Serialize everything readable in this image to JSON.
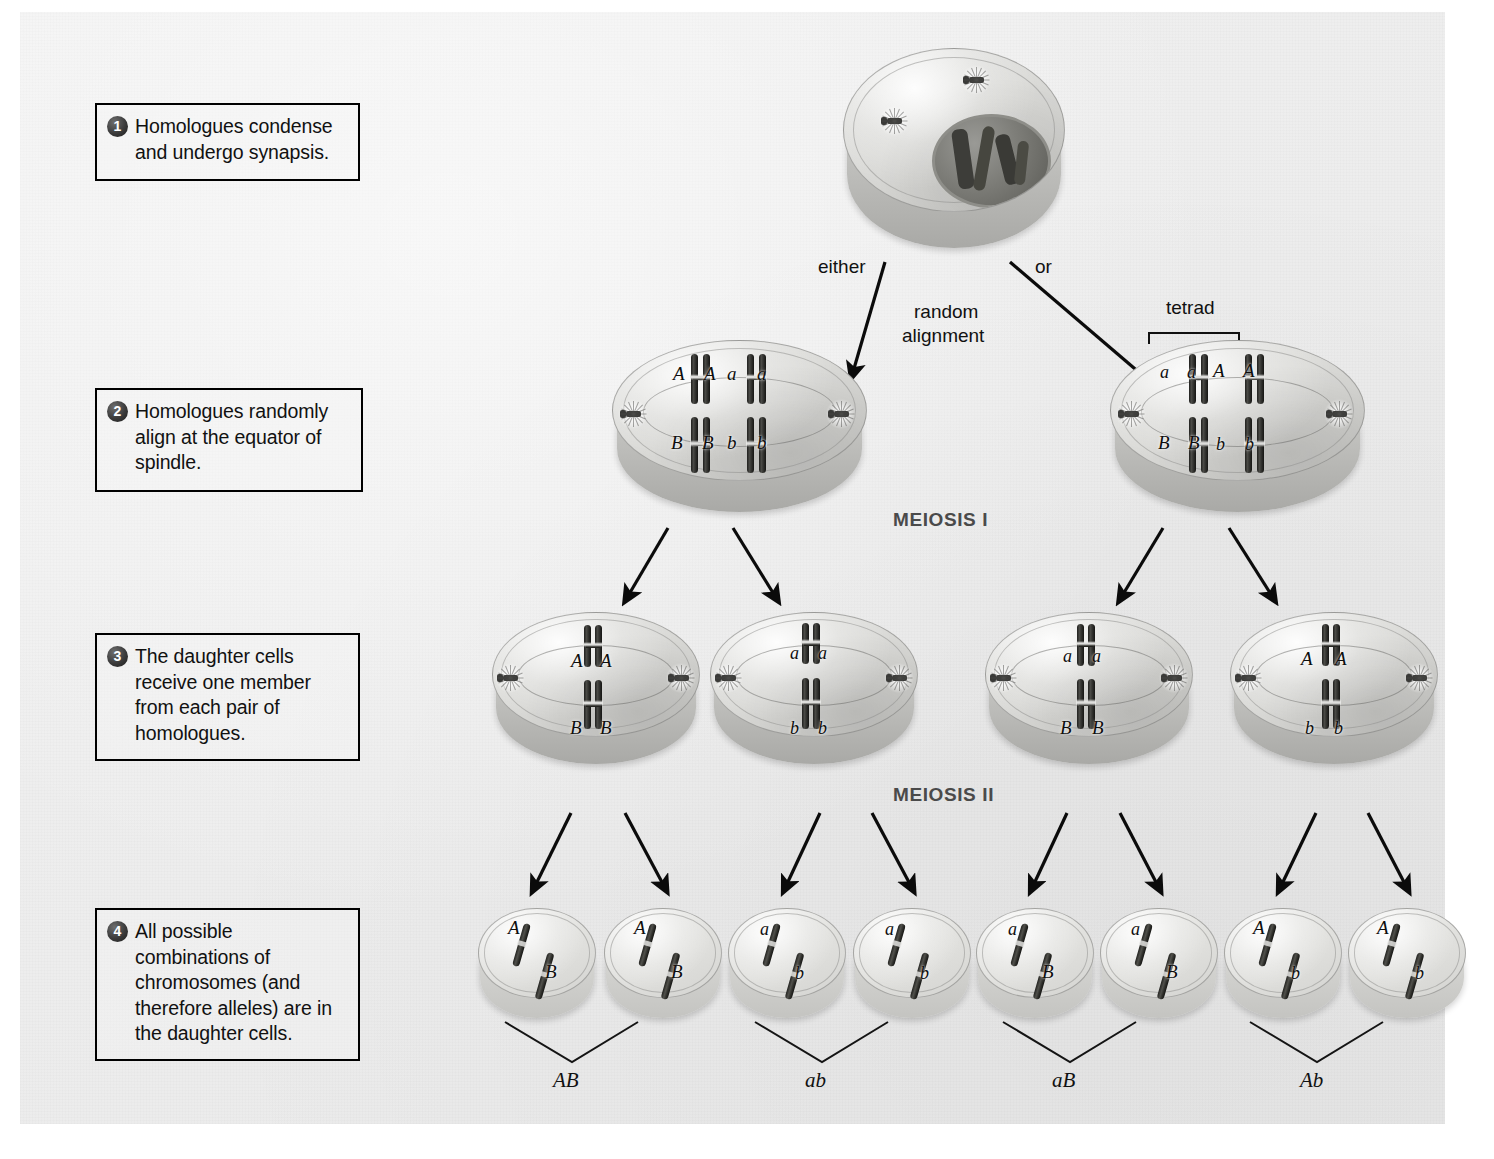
{
  "steps": [
    {
      "number": "1",
      "text": "Homologues condense and undergo synapsis."
    },
    {
      "number": "2",
      "text": "Homologues randomly align at the equator of spindle."
    },
    {
      "number": "3",
      "text": "The daughter cells receive one member from each pair of homologues."
    },
    {
      "number": "4",
      "text": "All possible combinations of chromosomes (and therefore alleles) are in the daughter cells."
    }
  ],
  "labels": {
    "either": "either",
    "or": "or",
    "random_alignment": "random\nalignment",
    "random_alignment_line1": "random",
    "random_alignment_line2": "alignment",
    "tetrad": "tetrad",
    "meiosis_i": "MEIOSIS I",
    "meiosis_ii": "MEIOSIS II"
  },
  "prophase_cell": {
    "name": "prophase-I-cell",
    "description": "Cell with intact nucleus containing condensing homologues and two centrosomes"
  },
  "metaphase_i_cells": [
    {
      "name": "metaphase-I-left",
      "top_alleles": [
        "A",
        "A",
        "a",
        "a"
      ],
      "bottom_alleles": [
        "B",
        "B",
        "b",
        "b"
      ],
      "tetrad_bracket": false
    },
    {
      "name": "metaphase-I-right",
      "top_alleles": [
        "a",
        "a",
        "A",
        "A"
      ],
      "bottom_alleles": [
        "B",
        "B",
        "b",
        "b"
      ],
      "tetrad_bracket": true
    }
  ],
  "meiosis_ii_cells": [
    {
      "name": "meiosis-II-cell-1",
      "top_alleles": [
        "A",
        "A"
      ],
      "bottom_alleles": [
        "B",
        "B"
      ]
    },
    {
      "name": "meiosis-II-cell-2",
      "top_alleles": [
        "a",
        "a"
      ],
      "bottom_alleles": [
        "b",
        "b"
      ]
    },
    {
      "name": "meiosis-II-cell-3",
      "top_alleles": [
        "a",
        "a"
      ],
      "bottom_alleles": [
        "B",
        "B"
      ]
    },
    {
      "name": "meiosis-II-cell-4",
      "top_alleles": [
        "A",
        "A"
      ],
      "bottom_alleles": [
        "b",
        "b"
      ]
    }
  ],
  "gametes": [
    {
      "name": "gamete-1",
      "upper_allele": "A",
      "lower_allele": "B"
    },
    {
      "name": "gamete-2",
      "upper_allele": "A",
      "lower_allele": "B"
    },
    {
      "name": "gamete-3",
      "upper_allele": "a",
      "lower_allele": "b"
    },
    {
      "name": "gamete-4",
      "upper_allele": "a",
      "lower_allele": "b"
    },
    {
      "name": "gamete-5",
      "upper_allele": "a",
      "lower_allele": "B"
    },
    {
      "name": "gamete-6",
      "upper_allele": "a",
      "lower_allele": "B"
    },
    {
      "name": "gamete-7",
      "upper_allele": "A",
      "lower_allele": "b"
    },
    {
      "name": "gamete-8",
      "upper_allele": "A",
      "lower_allele": "b"
    }
  ],
  "genotype_groups": [
    {
      "name": "genotype-AB",
      "label": "AB"
    },
    {
      "name": "genotype-ab",
      "label": "ab"
    },
    {
      "name": "genotype-aB",
      "label": "aB"
    },
    {
      "name": "genotype-Ab",
      "label": "Ab"
    }
  ],
  "colors": {
    "background": "#ffffff",
    "plate": "#eeeeee",
    "ink": "#111111",
    "stage_label": "#4a4a4a",
    "chromosome": "#2c2c29"
  }
}
